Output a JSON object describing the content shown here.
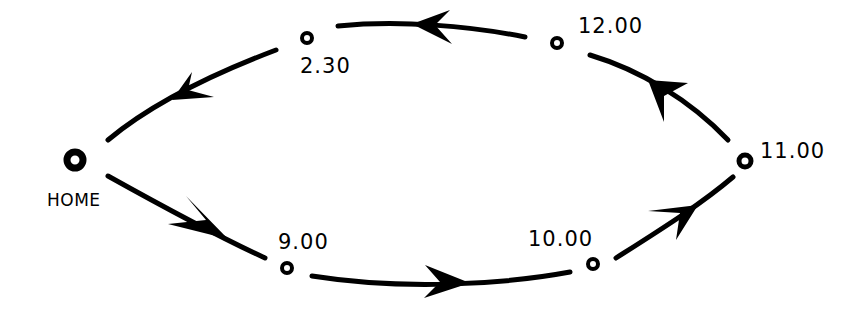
{
  "diagram": {
    "type": "cycle",
    "stroke_color": "#000000",
    "background": "#ffffff",
    "nodes": [
      {
        "id": "home",
        "label": "HOME",
        "x": 75,
        "y": 160,
        "r": 8,
        "stroke": 7
      },
      {
        "id": "n900",
        "label": "9.00",
        "x": 287,
        "y": 268,
        "r": 5,
        "stroke": 4
      },
      {
        "id": "n1000",
        "label": "10.00",
        "x": 593,
        "y": 264,
        "r": 5,
        "stroke": 4
      },
      {
        "id": "n1100",
        "label": "11.00",
        "x": 745,
        "y": 161,
        "r": 6,
        "stroke": 5
      },
      {
        "id": "n1200",
        "label": "12.00",
        "x": 557,
        "y": 43,
        "r": 5,
        "stroke": 4
      },
      {
        "id": "n230",
        "label": "2.30",
        "x": 307,
        "y": 38,
        "r": 5,
        "stroke": 4
      }
    ],
    "edges": [
      {
        "from": "home",
        "to": "n900"
      },
      {
        "from": "n900",
        "to": "n1000"
      },
      {
        "from": "n1000",
        "to": "n1100"
      },
      {
        "from": "n1100",
        "to": "n1200"
      },
      {
        "from": "n1200",
        "to": "n230"
      },
      {
        "from": "n230",
        "to": "home"
      }
    ]
  },
  "labels": {
    "home": "HOME",
    "t900": "9.00",
    "t1000": "10.00",
    "t1100": "11.00",
    "t1200": "12.00",
    "t230": "2.30"
  }
}
